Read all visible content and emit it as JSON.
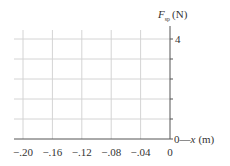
{
  "chart_data": {
    "type": "line",
    "title": "",
    "xlabel": "x (m)",
    "ylabel": "F_sp (N)",
    "ylabel_parts": {
      "symbol": "F",
      "subscript": "sp",
      "unit": "(N)"
    },
    "xlabel_parts": {
      "prefix": "0—",
      "symbol": "x",
      "unit": "(m)"
    },
    "xlim": [
      -0.2,
      0
    ],
    "ylim": [
      0,
      4
    ],
    "x_ticks": [
      -0.2,
      -0.16,
      -0.12,
      -0.08,
      -0.04,
      0
    ],
    "x_tick_labels": [
      "−.20",
      "−.16",
      "−.12",
      "−.08",
      "−.04",
      "0"
    ],
    "y_ticks": [
      0,
      0.8,
      1.6,
      2.4,
      3.2,
      4
    ],
    "y_tick_labels": [
      "0",
      "",
      "",
      "",
      "",
      "4"
    ],
    "grid": true,
    "series": [],
    "legend": null
  },
  "colors": {
    "grid": "#d4d4d4",
    "axis": "#555555",
    "text": "#333333",
    "background": "#ffffff"
  }
}
